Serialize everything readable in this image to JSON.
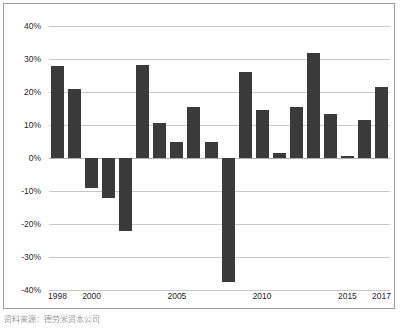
{
  "chart_data": {
    "type": "bar",
    "title": "",
    "subtitle": "",
    "xlabel": "",
    "ylabel": "",
    "grid": true,
    "legend": false,
    "ylim": [
      -40,
      40
    ],
    "ytick_labels": [
      "40%",
      "30%",
      "20%",
      "10%",
      "0%",
      "-10%",
      "-20%",
      "-30%",
      "-40%"
    ],
    "ytick_values": [
      40,
      30,
      20,
      10,
      0,
      -10,
      -20,
      -30,
      -40
    ],
    "xtick_labels": [
      "1998",
      "2000",
      "2005",
      "2010",
      "2015",
      "2017"
    ],
    "xtick_values": [
      1998,
      2000,
      2005,
      2010,
      2015,
      2017
    ],
    "categories": [
      "1998",
      "1999",
      "2000",
      "2001",
      "2002",
      "2003",
      "2004",
      "2005",
      "2006",
      "2007",
      "2008",
      "2009",
      "2010",
      "2011",
      "2012",
      "2013",
      "2014",
      "2015",
      "2016",
      "2017"
    ],
    "values": [
      28.0,
      20.8,
      -9.2,
      -12.2,
      -22.1,
      28.1,
      10.7,
      4.8,
      15.6,
      4.8,
      -37.5,
      26.0,
      14.6,
      1.6,
      15.6,
      31.8,
      13.4,
      0.7,
      11.4,
      21.5
    ],
    "bar_color": "#3a3a3a",
    "grid_color": "#c9c9c9"
  },
  "caption": {
    "text": "资料来源：德劳米资本公司"
  }
}
